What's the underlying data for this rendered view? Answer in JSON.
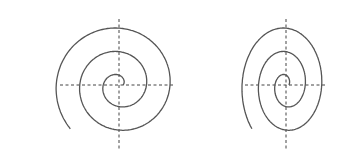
{
  "figure": {
    "width": 347,
    "height": 163,
    "background": "#ffffff",
    "stroke_color": "#555555",
    "axis_color": "#444444"
  },
  "spirals": [
    {
      "name": "circular-spiral",
      "center": [
        119,
        85
      ],
      "scale_x": 1.0,
      "scale_y": 1.0,
      "axes": {
        "x_range": [
          60,
          174
        ],
        "y_range": [
          19,
          151
        ]
      }
    },
    {
      "name": "elliptical-spiral",
      "center": [
        286,
        85
      ],
      "scale_x": 0.7,
      "scale_y": 1.0,
      "axes": {
        "x_range": [
          245,
          326
        ],
        "y_range": [
          19,
          151
        ]
      }
    }
  ]
}
